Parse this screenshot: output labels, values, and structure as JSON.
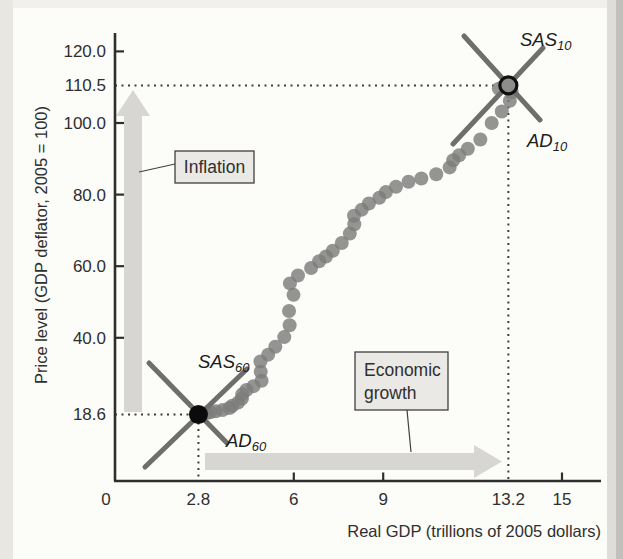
{
  "colors": {
    "axis": "#2e2e2e",
    "text": "#2f2f2f",
    "muted_label": "#9c9c9a",
    "dot": "#7d7d7b",
    "curve_line": "#6e6e6c",
    "arrow_gray": "#d7d6d2",
    "callout_fill": "#eae9e5",
    "background": "#fcfcf9",
    "scan_edge_left": "#e8e7e2",
    "scan_edge_right": "#c0c0be"
  },
  "annotations": {
    "inflation": "Inflation",
    "economic_growth": {
      "line1": "Economic",
      "line2": "growth"
    },
    "sas10": {
      "main": "SAS",
      "sub": "10"
    },
    "ad10": {
      "main": "AD",
      "sub": "10"
    },
    "sas60": {
      "main": "SAS",
      "sub": "60"
    },
    "ad60": {
      "main": "AD",
      "sub": "60"
    }
  },
  "chart_data": {
    "type": "scatter",
    "title": "",
    "xlabel": "Real GDP (trillions of 2005 dollars)",
    "ylabel": "Price level (GDP deflator, 2005 = 100)",
    "xlim": [
      0,
      16.3
    ],
    "ylim": [
      0,
      125
    ],
    "grid": false,
    "x_axis": {
      "ticks": [
        {
          "label": "0",
          "value": 0,
          "tick": false
        },
        {
          "label": "6",
          "value": 6,
          "tick": true
        },
        {
          "label": "9",
          "value": 9,
          "tick": true
        },
        {
          "label": "15",
          "value": 15,
          "tick": true
        }
      ],
      "special_labels": [
        {
          "label": "2.8",
          "value": 2.8,
          "color": "#2f2f2f"
        },
        {
          "label": "13.2",
          "value": 13.2,
          "color": "#9c9c9a"
        }
      ]
    },
    "y_axis": {
      "ticks": [
        {
          "label": "120.0",
          "value": 120,
          "tick": true
        },
        {
          "label": "100.0",
          "value": 100,
          "tick": true
        },
        {
          "label": "80.0",
          "value": 80,
          "tick": true
        },
        {
          "label": "60.0",
          "value": 60,
          "tick": true
        },
        {
          "label": "40.0",
          "value": 40,
          "tick": true
        }
      ],
      "special_labels": [
        {
          "label": "110.5",
          "value": 110.5,
          "color": "#9c9c9a"
        },
        {
          "label": "18.6",
          "value": 18.6,
          "color": "#2f2f2f"
        }
      ]
    },
    "series": [
      {
        "name": "US real GDP and price level, 1960-2010 (one dot per year)",
        "points": [
          [
            2.83,
            18.6
          ],
          [
            2.91,
            18.8
          ],
          [
            3.07,
            19.0
          ],
          [
            3.2,
            19.2
          ],
          [
            3.38,
            19.5
          ],
          [
            3.61,
            19.8
          ],
          [
            3.84,
            20.4
          ],
          [
            3.94,
            21.0
          ],
          [
            4.13,
            21.9
          ],
          [
            4.26,
            23.0
          ],
          [
            4.27,
            24.2
          ],
          [
            4.41,
            25.4
          ],
          [
            4.65,
            26.5
          ],
          [
            4.92,
            28.0
          ],
          [
            4.89,
            30.5
          ],
          [
            4.88,
            33.4
          ],
          [
            5.14,
            35.3
          ],
          [
            5.38,
            37.5
          ],
          [
            5.68,
            40.2
          ],
          [
            5.86,
            43.5
          ],
          [
            5.84,
            47.5
          ],
          [
            5.99,
            52.0
          ],
          [
            5.87,
            55.2
          ],
          [
            6.14,
            57.4
          ],
          [
            6.58,
            59.5
          ],
          [
            6.85,
            61.4
          ],
          [
            7.08,
            62.7
          ],
          [
            7.31,
            64.3
          ],
          [
            7.61,
            66.5
          ],
          [
            7.88,
            69.1
          ],
          [
            8.03,
            71.7
          ],
          [
            8.02,
            74.1
          ],
          [
            8.28,
            75.8
          ],
          [
            8.52,
            77.5
          ],
          [
            8.87,
            79.1
          ],
          [
            9.09,
            80.7
          ],
          [
            9.43,
            82.2
          ],
          [
            9.85,
            83.6
          ],
          [
            10.28,
            84.5
          ],
          [
            10.78,
            85.7
          ],
          [
            11.23,
            87.6
          ],
          [
            11.35,
            89.6
          ],
          [
            11.55,
            91.0
          ],
          [
            11.84,
            92.8
          ],
          [
            12.26,
            95.4
          ],
          [
            12.64,
            100.0
          ],
          [
            12.98,
            103.2
          ],
          [
            13.25,
            106.2
          ],
          [
            13.31,
            108.6
          ],
          [
            12.88,
            109.6
          ],
          [
            13.2,
            110.5
          ]
        ]
      }
    ],
    "equilibria": [
      {
        "x": 2.8,
        "y": 18.6,
        "marker": "solid-black",
        "sas_label": "SAS60",
        "ad_label": "AD60"
      },
      {
        "x": 13.2,
        "y": 110.5,
        "marker": "outlined-gray",
        "sas_label": "SAS10",
        "ad_label": "AD10"
      }
    ]
  }
}
